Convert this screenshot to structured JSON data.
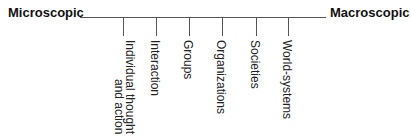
{
  "diagram": {
    "left_label": "Microscopic",
    "right_label": "Macroscopic",
    "categories": [
      {
        "line1": "Individual thought",
        "line2": "and action",
        "tick_x": 123
      },
      {
        "line1": "Interaction",
        "line2": "",
        "tick_x": 156
      },
      {
        "line1": "Groups",
        "line2": "",
        "tick_x": 189
      },
      {
        "line1": "Organizations",
        "line2": "",
        "tick_x": 222
      },
      {
        "line1": "Societies",
        "line2": "",
        "tick_x": 256
      },
      {
        "line1": "World-systems",
        "line2": "",
        "tick_x": 288
      }
    ],
    "colors": {
      "line": "#555555",
      "text": "#111111"
    }
  }
}
